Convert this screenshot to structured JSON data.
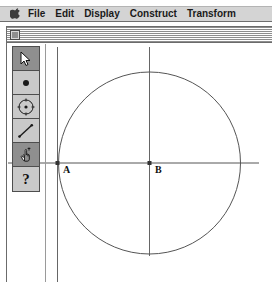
{
  "menubar": {
    "apple_icon": "apple-logo-icon",
    "items": [
      {
        "label": "File"
      },
      {
        "label": "Edit"
      },
      {
        "label": "Display"
      },
      {
        "label": "Construct"
      },
      {
        "label": "Transform"
      }
    ]
  },
  "window": {
    "title": "",
    "close_box_name": "close-box"
  },
  "toolbar": {
    "tools": [
      {
        "name": "selection-arrow-tool",
        "icon": "arrow-cursor-icon",
        "selected": true
      },
      {
        "name": "point-tool",
        "icon": "point-icon",
        "selected": false
      },
      {
        "name": "compass-circle-tool",
        "icon": "circle-compass-icon",
        "selected": false
      },
      {
        "name": "straightedge-line-tool",
        "icon": "line-segment-icon",
        "selected": false
      },
      {
        "name": "text-label-tool",
        "icon": "labeling-hand-icon",
        "selected": true
      },
      {
        "name": "info-help-tool",
        "icon": "question-mark-icon",
        "selected": false
      }
    ]
  },
  "sketch": {
    "circle": {
      "cx": 148,
      "cy": 163,
      "r": 91,
      "stroke": "#555555"
    },
    "points": [
      {
        "id": "A",
        "label": "A",
        "x": 56,
        "y": 163,
        "label_x": 60,
        "label_y": 164
      },
      {
        "id": "B",
        "label": "B",
        "x": 148,
        "y": 163,
        "label_x": 152,
        "label_y": 164
      }
    ],
    "lines": [
      {
        "name": "horizontal-axis-line",
        "x1": 0,
        "y1": 163,
        "x2": 258,
        "y2": 163
      },
      {
        "name": "vertical-line-through-a",
        "x1": 56,
        "y1": 47,
        "x2": 56,
        "y2": 281
      },
      {
        "name": "vertical-line-through-b",
        "x1": 148,
        "y1": 47,
        "x2": 148,
        "y2": 255
      }
    ],
    "stroke_color": "#555555",
    "point_color": "#333333"
  }
}
